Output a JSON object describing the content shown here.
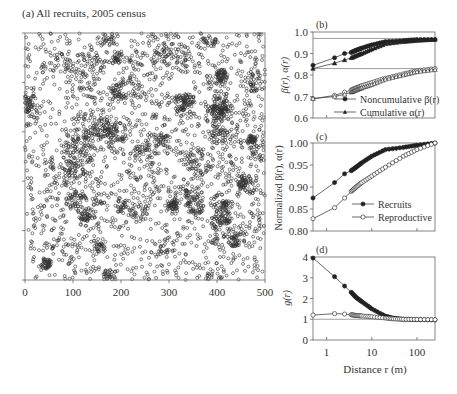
{
  "chart_data": [
    {
      "id": "a",
      "type": "scatter",
      "title": "(a) All recruits, 2005 census",
      "xlabel": "",
      "ylabel": "",
      "xlim": [
        0,
        500
      ],
      "ylim": [
        0,
        500
      ],
      "x_ticks": [
        "0",
        "100",
        "200",
        "300",
        "400",
        "500"
      ],
      "y_ticks": [],
      "marker": "open circle",
      "description": "Dense spatial point pattern of recruit locations over a 500 x 500 m plot with strong clustering (dark aggregations)"
    },
    {
      "id": "b",
      "type": "line",
      "title": "(b)",
      "xlabel": "",
      "ylabel": "β(r), α(r)",
      "ylim": [
        0.6,
        1.0
      ],
      "y_ticks": [
        "0.6",
        "0.7",
        "0.8",
        "0.9",
        "1.0"
      ],
      "x_scale": "log",
      "xlim": [
        0.5,
        250
      ],
      "legend": [
        "Noncumulative β(r)",
        "Cumulative α(r)"
      ],
      "reference_lines": [
        0.97,
        0.83
      ],
      "series": [
        {
          "name": "Noncumulative β(r) – recruits",
          "marker": "filled circle",
          "x": [
            0.5,
            1.5,
            2.5,
            3.5,
            4.5,
            6,
            10,
            20,
            50,
            100,
            250
          ],
          "values": [
            0.845,
            0.88,
            0.9,
            0.905,
            0.915,
            0.925,
            0.94,
            0.955,
            0.96,
            0.965,
            0.965
          ]
        },
        {
          "name": "Cumulative α(r) – recruits",
          "marker": "filled triangle",
          "x": [
            0.5,
            1.5,
            2.5,
            3.5,
            4.5,
            6,
            10,
            20,
            50,
            100,
            250
          ],
          "values": [
            0.83,
            0.855,
            0.87,
            0.88,
            0.89,
            0.9,
            0.92,
            0.945,
            0.955,
            0.96,
            0.965
          ]
        },
        {
          "name": "Noncumulative β(r) – reproductive",
          "marker": "open circle",
          "x": [
            0.5,
            1.5,
            2.5,
            3.5,
            4.5,
            6,
            10,
            20,
            50,
            100,
            250
          ],
          "values": [
            0.69,
            0.705,
            0.72,
            0.73,
            0.74,
            0.75,
            0.765,
            0.785,
            0.805,
            0.82,
            0.83
          ]
        },
        {
          "name": "Cumulative α(r) – reproductive",
          "marker": "open triangle",
          "x": [
            0.5,
            1.5,
            2.5,
            3.5,
            4.5,
            6,
            10,
            20,
            50,
            100,
            250
          ],
          "values": [
            0.69,
            0.7,
            0.71,
            0.72,
            0.73,
            0.74,
            0.755,
            0.78,
            0.8,
            0.815,
            0.825
          ]
        }
      ]
    },
    {
      "id": "c",
      "type": "line",
      "title": "(c)",
      "xlabel": "",
      "ylabel": "Normalized β(r), α(r)",
      "ylim": [
        0.8,
        1.0
      ],
      "y_ticks": [
        "0.80",
        "0.85",
        "0.90",
        "0.95",
        "1.00"
      ],
      "x_scale": "log",
      "xlim": [
        0.5,
        250
      ],
      "legend": [
        "Recruits",
        "Reproductive"
      ],
      "series": [
        {
          "name": "Recruits",
          "marker": "filled circle",
          "x": [
            0.5,
            1.5,
            2.5,
            3.5,
            4.5,
            6,
            10,
            20,
            50,
            100,
            250
          ],
          "values": [
            0.875,
            0.91,
            0.93,
            0.937,
            0.945,
            0.955,
            0.97,
            0.985,
            0.99,
            0.995,
            1.0
          ]
        },
        {
          "name": "Reproductive",
          "marker": "open circle",
          "x": [
            0.5,
            1.5,
            2.5,
            3.5,
            4.5,
            6,
            10,
            20,
            50,
            100,
            250
          ],
          "values": [
            0.828,
            0.853,
            0.875,
            0.89,
            0.9,
            0.91,
            0.925,
            0.945,
            0.97,
            0.985,
            1.0
          ]
        }
      ]
    },
    {
      "id": "d",
      "type": "line",
      "title": "(d)",
      "xlabel": "Distance r (m)",
      "ylabel": "g(r)",
      "ylim": [
        0,
        4
      ],
      "y_ticks": [
        "0",
        "1",
        "2",
        "3",
        "4"
      ],
      "x_scale": "log",
      "xlim": [
        0.5,
        250
      ],
      "x_ticks": [
        "1",
        "10",
        "100"
      ],
      "reference_lines": [
        1.0
      ],
      "series": [
        {
          "name": "Recruits",
          "marker": "filled circle",
          "x": [
            0.5,
            1.5,
            2.5,
            3.5,
            4.5,
            6,
            10,
            20,
            30,
            50,
            100,
            250
          ],
          "values": [
            3.95,
            3.05,
            2.6,
            2.3,
            2.05,
            1.85,
            1.5,
            1.15,
            1.05,
            1.0,
            0.98,
            0.97
          ]
        },
        {
          "name": "Reproductive",
          "marker": "open circle",
          "x": [
            0.5,
            1.5,
            2.5,
            3.5,
            4.5,
            6,
            10,
            20,
            30,
            50,
            100,
            250
          ],
          "values": [
            1.2,
            1.27,
            1.25,
            1.22,
            1.18,
            1.16,
            1.12,
            1.06,
            1.02,
            1.0,
            0.99,
            0.98
          ]
        }
      ]
    }
  ],
  "labels": {
    "panel_a_title": "(a) All recruits, 2005 census",
    "panel_b_title": "(b)",
    "panel_c_title": "(c)",
    "panel_d_title": "(d)",
    "b_ylabel": "β(r), α(r)",
    "cd_ylabel": "Normalized β(r), α(r)",
    "d_ylabel": "g(r)",
    "d_xlabel": "Distance r (m)",
    "b_legend_1": "Noncumulative β(r)",
    "b_legend_2": "Cumulative α(r)",
    "c_legend_1": "Recruits",
    "c_legend_2": "Reproductive"
  }
}
